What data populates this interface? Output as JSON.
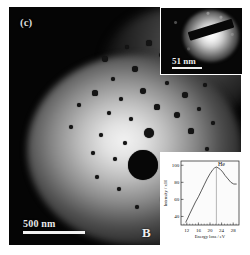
{
  "figure": {
    "panel_label": "(c)",
    "background_color": "#ffffff"
  },
  "micrograph": {
    "name": "tem-bright-field-micrograph",
    "scalebar": {
      "label": "500 nm",
      "length_px": 62
    },
    "region_label": "B",
    "bubbles": [
      {
        "x": 96,
        "y": 52,
        "r": 3.0
      },
      {
        "x": 118,
        "y": 40,
        "r": 2.2
      },
      {
        "x": 140,
        "y": 36,
        "r": 2.6
      },
      {
        "x": 152,
        "y": 48,
        "r": 2.0
      },
      {
        "x": 166,
        "y": 54,
        "r": 3.2
      },
      {
        "x": 178,
        "y": 44,
        "r": 2.4
      },
      {
        "x": 188,
        "y": 60,
        "r": 2.0
      },
      {
        "x": 126,
        "y": 62,
        "r": 2.8
      },
      {
        "x": 104,
        "y": 72,
        "r": 2.2
      },
      {
        "x": 86,
        "y": 86,
        "r": 2.6
      },
      {
        "x": 112,
        "y": 92,
        "r": 2.0
      },
      {
        "x": 134,
        "y": 84,
        "r": 3.4
      },
      {
        "x": 158,
        "y": 76,
        "r": 2.4
      },
      {
        "x": 176,
        "y": 88,
        "r": 2.8
      },
      {
        "x": 196,
        "y": 78,
        "r": 2.2
      },
      {
        "x": 148,
        "y": 100,
        "r": 2.6
      },
      {
        "x": 168,
        "y": 108,
        "r": 3.0
      },
      {
        "x": 190,
        "y": 102,
        "r": 2.2
      },
      {
        "x": 122,
        "y": 112,
        "r": 2.4
      },
      {
        "x": 100,
        "y": 106,
        "r": 2.0
      },
      {
        "x": 140,
        "y": 126,
        "r": 5.0
      },
      {
        "x": 182,
        "y": 124,
        "r": 2.6
      },
      {
        "x": 204,
        "y": 116,
        "r": 2.2
      },
      {
        "x": 116,
        "y": 136,
        "r": 2.4
      },
      {
        "x": 92,
        "y": 128,
        "r": 2.0
      },
      {
        "x": 134,
        "y": 158,
        "r": 15.0
      },
      {
        "x": 176,
        "y": 150,
        "r": 2.8
      },
      {
        "x": 198,
        "y": 142,
        "r": 2.2
      },
      {
        "x": 106,
        "y": 152,
        "r": 2.4
      },
      {
        "x": 84,
        "y": 146,
        "r": 2.0
      },
      {
        "x": 166,
        "y": 174,
        "r": 2.6
      },
      {
        "x": 190,
        "y": 166,
        "r": 2.2
      },
      {
        "x": 110,
        "y": 182,
        "r": 2.4
      },
      {
        "x": 88,
        "y": 170,
        "r": 2.0
      },
      {
        "x": 154,
        "y": 192,
        "r": 2.6
      },
      {
        "x": 178,
        "y": 196,
        "r": 2.2
      },
      {
        "x": 128,
        "y": 200,
        "r": 2.0
      },
      {
        "x": 200,
        "y": 186,
        "r": 2.4
      },
      {
        "x": 62,
        "y": 120,
        "r": 2.0
      },
      {
        "x": 70,
        "y": 98,
        "r": 1.8
      }
    ]
  },
  "inset_diffraction": {
    "name": "selected-area-diffraction-inset",
    "scalebar": {
      "label": "51 nm",
      "length_px": 30
    },
    "beam_stop": "beam-stop-bar"
  },
  "chart_data": {
    "type": "line",
    "title": "",
    "xlabel": "Energy loss / eV",
    "ylabel": "Intensity / x10",
    "xlim": [
      10,
      30
    ],
    "ylim": [
      30,
      105
    ],
    "xticks": [
      12,
      16,
      20,
      24,
      28
    ],
    "yticks": [
      40,
      60,
      80,
      100
    ],
    "grid": false,
    "legend": "none",
    "annotations": [
      {
        "label": "He",
        "x": 22.2,
        "y": 98
      }
    ],
    "series": [
      {
        "name": "EELS low-loss spectrum",
        "color": "#4a4a4a",
        "x": [
          11.6,
          12.2,
          13.0,
          14.0,
          15.0,
          16.0,
          17.0,
          18.0,
          19.0,
          20.0,
          21.0,
          21.6,
          22.2,
          22.8,
          23.6,
          24.4,
          25.2,
          26.2,
          27.2,
          28.2,
          29.2
        ],
        "y": [
          33,
          37,
          43,
          50,
          57,
          63,
          70,
          77,
          84,
          90,
          95,
          97,
          98,
          97,
          95,
          92,
          88,
          84,
          80,
          78,
          78
        ]
      }
    ]
  }
}
